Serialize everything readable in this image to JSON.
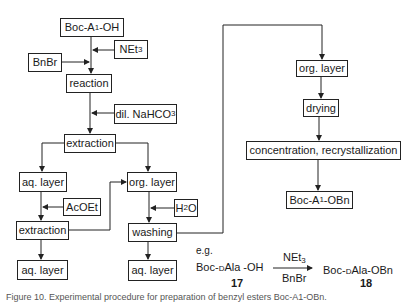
{
  "flowchart": {
    "nodes": {
      "start": {
        "pre": "Boc-A",
        "sub": "1",
        "post": "-OH"
      },
      "net3": {
        "pre": "NEt",
        "sub": "3",
        "post": ""
      },
      "bnbr": {
        "label": "BnBr"
      },
      "reaction": {
        "label": "reaction"
      },
      "nahco3": {
        "pre": "dil. NaHCO",
        "sub": "3",
        "post": ""
      },
      "extraction1": {
        "label": "extraction"
      },
      "aq_layer1": {
        "label": "aq. layer"
      },
      "org_layer1": {
        "label": "org. layer"
      },
      "acoet": {
        "label": "AcOEt"
      },
      "extraction2": {
        "label": "extraction"
      },
      "h2o": {
        "pre": "H",
        "sub": "2",
        "post": "O"
      },
      "washing": {
        "label": "washing"
      },
      "aq_layer2": {
        "label": "aq. layer"
      },
      "aq_layer3": {
        "label": "aq. layer"
      },
      "org_layer2": {
        "label": "org. layer"
      },
      "drying": {
        "label": "drying"
      },
      "concentration": {
        "label": "concentration, recrystallization"
      },
      "product": {
        "pre": "Boc-A",
        "sub": "1",
        "post": "-OBn"
      }
    },
    "edges": [
      [
        "start",
        "reaction"
      ],
      [
        "net3",
        "reaction"
      ],
      [
        "bnbr",
        "reaction"
      ],
      [
        "reaction",
        "extraction1"
      ],
      [
        "nahco3",
        "extraction1"
      ],
      [
        "extraction1",
        "aq_layer1"
      ],
      [
        "extraction1",
        "org_layer1"
      ],
      [
        "aq_layer1",
        "extraction2"
      ],
      [
        "acoet",
        "extraction2"
      ],
      [
        "extraction2",
        "aq_layer2"
      ],
      [
        "extraction2",
        "org_layer1"
      ],
      [
        "org_layer1",
        "washing"
      ],
      [
        "h2o",
        "washing"
      ],
      [
        "washing",
        "aq_layer3"
      ],
      [
        "washing",
        "org_layer2"
      ],
      [
        "org_layer2",
        "drying"
      ],
      [
        "drying",
        "concentration"
      ],
      [
        "concentration",
        "product"
      ]
    ]
  },
  "example": {
    "eg": "e.g.",
    "reactant": {
      "pre": "Boc-",
      "sc": "D",
      "mid": "Ala -OH"
    },
    "reactant_num": "17",
    "reagent_top": {
      "pre": "NEt",
      "sub": "3"
    },
    "reagent_bottom": "BnBr",
    "product": {
      "pre": "Boc-",
      "sc": "D",
      "mid": "Ala-OBn"
    },
    "product_num": "18"
  },
  "caption": "Figure 10. Experimental procedure for preparation of benzyl esters Boc-A1-OBn."
}
